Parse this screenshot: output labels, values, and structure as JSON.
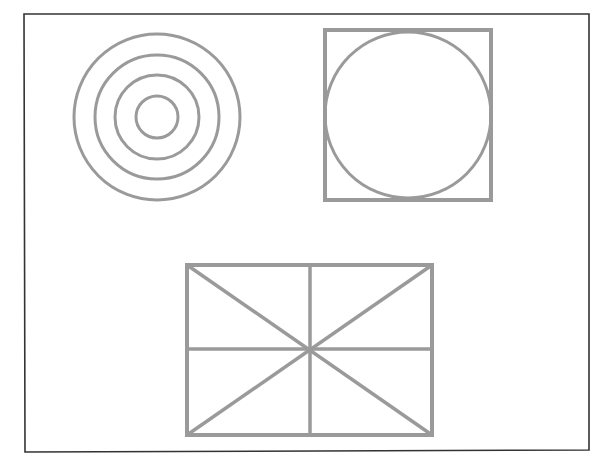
{
  "canvas": {
    "width": 606,
    "height": 470,
    "background": "#ffffff"
  },
  "frame": {
    "x1": 24,
    "y1": 14,
    "x2": 589,
    "y2": 14,
    "x3": 589,
    "y3": 450,
    "x4": 25,
    "y4": 452,
    "stroke": "#333333",
    "width": 1.6
  },
  "style": {
    "shape_stroke": "#9a9a9a",
    "stroke_width": 3
  },
  "concentric_circles": {
    "cx": 157,
    "cy": 117,
    "radii": [
      83,
      62,
      42,
      21
    ]
  },
  "square_with_circle": {
    "square": {
      "x": 325,
      "y": 30,
      "w": 166,
      "h": 170
    },
    "circle": {
      "cx": 408,
      "cy": 115,
      "r": 83
    }
  },
  "divided_rectangle": {
    "rect": {
      "x": 187,
      "y": 265,
      "w": 245,
      "h": 170
    },
    "center": {
      "x": 310,
      "y": 349
    }
  }
}
